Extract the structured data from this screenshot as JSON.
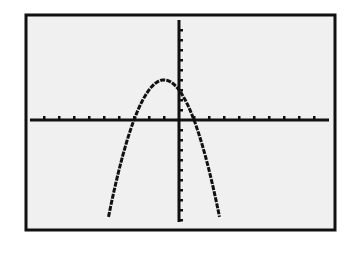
{
  "chart_data": {
    "type": "line",
    "title": "",
    "xlabel": "",
    "ylabel": "",
    "function": "y = -x^2 - 2x + 3",
    "window": {
      "xmin": -10,
      "xmax": 10,
      "xscl": 1,
      "ymin": -10,
      "ymax": 10,
      "yscl": 1
    },
    "grid": false,
    "legend": null,
    "series": [
      {
        "name": "Y1",
        "x": [
          -4.7,
          -4,
          -3,
          -2,
          -1,
          0,
          1,
          2,
          2.7
        ],
        "y": [
          -10.69,
          -5,
          0,
          3,
          4,
          3,
          0,
          -5,
          -9.69
        ]
      }
    ],
    "key_points": {
      "vertex": [
        -1,
        4
      ],
      "x_intercepts": [
        -3,
        1
      ],
      "y_intercept": 3
    }
  },
  "colors": {
    "screen_background": "#f0f0f0",
    "ink": "#111111",
    "page_background": "#ffffff"
  }
}
